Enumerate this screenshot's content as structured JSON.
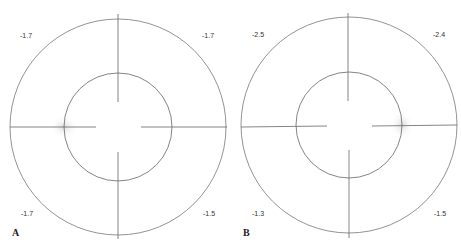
{
  "figure": {
    "colors": {
      "line": "#777777",
      "text": "#333333",
      "highlight": "#dddddd"
    },
    "panels": [
      {
        "label": "A",
        "center": [
          118,
          127
        ],
        "outer_radius": 108,
        "inner_radius": 54,
        "highlight_side": "left",
        "values": {
          "top_left": "-1.7",
          "top_right": "-1.7",
          "bottom_left": "-1.7",
          "bottom_right": "-1.5"
        }
      },
      {
        "label": "B",
        "center": [
          349,
          125
        ],
        "outer_radius": 108,
        "inner_radius": 53,
        "highlight_side": "right",
        "values": {
          "top_left": "-2.5",
          "top_right": "-2.4",
          "bottom_left": "-1.3",
          "bottom_right": "-1.5"
        }
      }
    ]
  }
}
